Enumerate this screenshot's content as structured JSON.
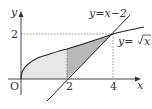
{
  "diagram": {
    "origin_label": "O",
    "x_axis_label": "x",
    "y_axis_label": "y",
    "x_ticks": [
      "2",
      "4"
    ],
    "y_ticks": [
      "2"
    ],
    "curves": [
      {
        "name": "sqrt",
        "label": "y=√x",
        "label_prefix": "y=",
        "label_radicand": "x"
      },
      {
        "name": "line",
        "label": "y=x−2"
      }
    ],
    "intersection": {
      "x": 4,
      "y": 2
    },
    "shading": {
      "light_region": "between y=√x and x-axis for 0≤x≤2",
      "dark_region": "between y=√x and y=x−2 for 2≤x≤4"
    },
    "colors": {
      "curve": "#222222",
      "light_fill": "#e3e3e3",
      "dark_fill": "#b5b5b5",
      "guide": "#555555"
    }
  }
}
